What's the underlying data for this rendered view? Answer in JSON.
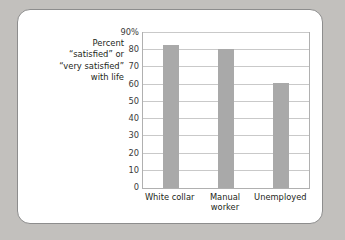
{
  "caption": {
    "text": "Percent\n“satisfied” or\n“very satisfied”\nwith life"
  },
  "colors": {
    "bar": "#a9a9a9",
    "gridline": "#c9c9c9",
    "plot_border": "#b0b0b0",
    "card_background": "#ffffff",
    "card_border": "#8d8d8d",
    "page_background": "#c2c0bd",
    "text": "#231f20"
  },
  "chart_data": {
    "type": "bar",
    "title": "",
    "subtitle": "",
    "xlabel": "",
    "ylabel": "Percent “satisfied” or “very satisfied” with life",
    "categories": [
      "White collar",
      "Manual worker",
      "Unemployed"
    ],
    "category_lines": [
      [
        "White collar"
      ],
      [
        "Manual",
        "worker"
      ],
      [
        "Unemployed"
      ]
    ],
    "values": [
      83,
      81,
      61
    ],
    "ylim": [
      0,
      90
    ],
    "yticks": [
      0,
      10,
      20,
      30,
      40,
      50,
      60,
      70,
      80,
      90
    ],
    "ytick_labels": [
      "0",
      "10",
      "20",
      "30",
      "40",
      "50",
      "60",
      "70",
      "80",
      "90%"
    ],
    "grid": true,
    "grid_axis": "y",
    "legend": false,
    "legend_position": "none"
  }
}
